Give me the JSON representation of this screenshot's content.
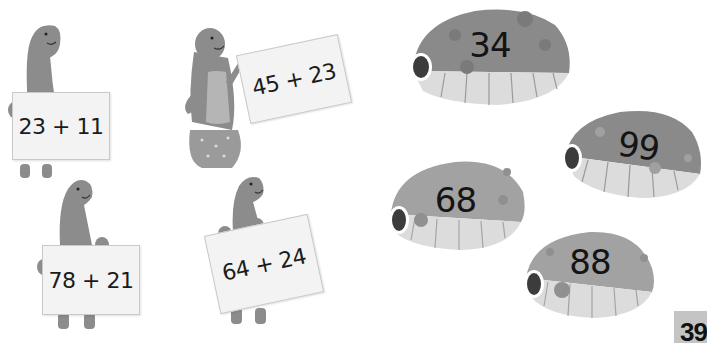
{
  "colors": {
    "dino_body": "#8c8c8c",
    "dino_belly": "#a8a8a8",
    "sign_bg": "#f3f3f3",
    "shell_top": "#8a8a8a",
    "shell_bottom": "#dcdcdc",
    "shell_eye": "#3c3c3c",
    "page_tab": "#c4c4c4"
  },
  "dinosaurs": [
    {
      "expression": "23 + 11"
    },
    {
      "expression": "45 + 23"
    },
    {
      "expression": "78 + 21"
    },
    {
      "expression": "64 + 24"
    }
  ],
  "shells": [
    {
      "value": "34"
    },
    {
      "value": "99"
    },
    {
      "value": "68"
    },
    {
      "value": "88"
    }
  ],
  "page": {
    "number": "39"
  }
}
